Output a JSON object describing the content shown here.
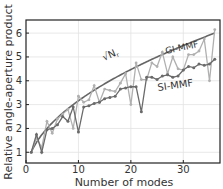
{
  "chart_data": {
    "type": "line",
    "title": "",
    "xlabel": "Number of modes",
    "ylabel": "Relative angle-aperture product",
    "xlim": [
      0,
      37
    ],
    "ylim": [
      0.55,
      6.55
    ],
    "xticks": [
      0,
      10,
      20,
      30
    ],
    "yticks": [
      1,
      2,
      3,
      4,
      5,
      6
    ],
    "grid": true,
    "legend": "inline annotations",
    "annotations": [
      {
        "text": "√N",
        "subscript": "r",
        "near_series": "sqrt_curve"
      },
      {
        "text": "GI-MMF",
        "near_series": "GI-MMF"
      },
      {
        "text": "SI-MMF",
        "near_series": "SI-MMF"
      }
    ],
    "x": [
      1,
      2,
      3,
      4,
      5,
      6,
      7,
      8,
      9,
      10,
      11,
      12,
      13,
      14,
      15,
      16,
      17,
      18,
      19,
      20,
      21,
      22,
      23,
      24,
      25,
      26,
      27,
      28,
      29,
      30,
      31,
      32,
      33,
      34,
      35,
      36
    ],
    "series": [
      {
        "name": "√N_r",
        "style": "smooth line",
        "color": "#666666",
        "x_range": [
          1,
          36
        ],
        "formula": "sqrt(x)"
      },
      {
        "name": "GI-MMF",
        "style": "line with markers",
        "color": "#b0b0b0",
        "values": [
          1.0,
          1.6,
          1.2,
          2.3,
          1.8,
          2.4,
          2.6,
          2.8,
          2.0,
          3.35,
          3.1,
          3.2,
          3.8,
          3.1,
          3.65,
          3.6,
          3.55,
          3.9,
          4.3,
          3.0,
          4.75,
          4.05,
          4.05,
          4.75,
          4.6,
          5.2,
          4.3,
          5.0,
          4.5,
          4.45,
          5.1,
          5.1,
          5.25,
          5.75,
          4.0,
          6.15
        ]
      },
      {
        "name": "SI-MMF",
        "style": "line with markers",
        "color": "#6a6a6a",
        "values": [
          1.0,
          1.75,
          1.0,
          1.95,
          2.0,
          2.15,
          2.5,
          2.3,
          2.9,
          1.85,
          2.9,
          2.95,
          3.05,
          3.1,
          3.25,
          3.3,
          3.35,
          3.65,
          3.7,
          3.75,
          3.75,
          2.7,
          4.15,
          4.15,
          4.05,
          4.2,
          4.25,
          4.15,
          4.2,
          4.45,
          4.6,
          4.55,
          4.7,
          4.65,
          4.7,
          4.9
        ]
      }
    ]
  },
  "labels": {
    "xlabel": "Number of modes",
    "ylabel": "Relative angle-aperture product",
    "sqrt_label": "√N",
    "sqrt_sub": "r",
    "gi_label": "GI-MMF",
    "si_label": "SI-MMF"
  }
}
